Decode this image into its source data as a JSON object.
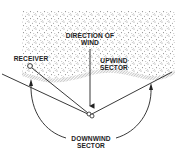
{
  "diagram": {
    "labels": {
      "direction_line1": "DIRECTION OF",
      "direction_line2": "WIND",
      "upwind_line1": "UPWIND",
      "upwind_line2": "SECTOR",
      "receiver": "RECEIVER",
      "downwind_line1": "DOWNWIND",
      "downwind_line2": "SECTOR"
    },
    "colors": {
      "ink": "#222222",
      "stipple": "#8a8a8a",
      "background": "#ffffff"
    }
  }
}
